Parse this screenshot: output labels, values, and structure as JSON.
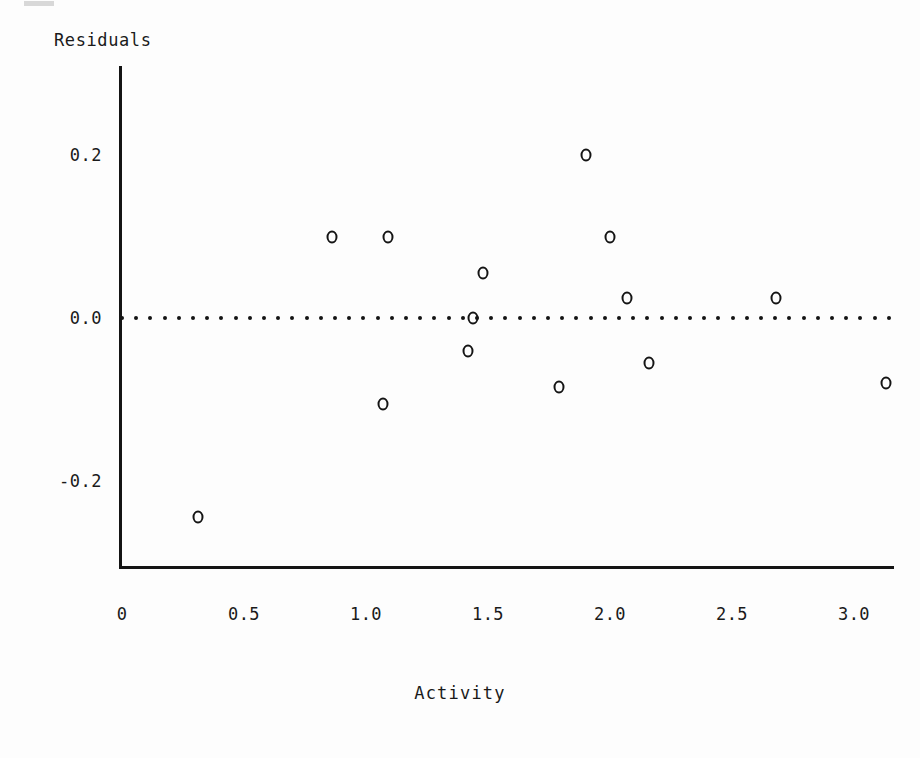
{
  "figure": {
    "y_axis_title": "Residuals",
    "x_axis_title": "Activity"
  },
  "chart_data": {
    "type": "scatter",
    "title": "",
    "xlabel": "Activity",
    "ylabel": "Residuals",
    "xlim": [
      0.0,
      3.2
    ],
    "ylim": [
      -0.3,
      0.26
    ],
    "grid": false,
    "legend": null,
    "marker": "open-circle",
    "reference_line": {
      "orientation": "horizontal",
      "value": 0.0,
      "style": "dotted",
      "x_start": 0.0,
      "x_end": 3.15
    },
    "xticks": [
      0,
      0.5,
      1.0,
      1.5,
      2.0,
      2.5,
      3.0
    ],
    "xticklabels": [
      "0",
      "0.5",
      "1.0",
      "1.5",
      "2.0",
      "2.5",
      "3.0"
    ],
    "yticks": [
      0.2,
      0.0,
      -0.2
    ],
    "yticklabels": [
      "0.2",
      "0.0",
      "-0.2"
    ],
    "series": [
      {
        "name": "residuals",
        "points": [
          {
            "x": 0.31,
            "y": -0.244
          },
          {
            "x": 0.86,
            "y": 0.1
          },
          {
            "x": 1.07,
            "y": -0.105
          },
          {
            "x": 1.09,
            "y": 0.1
          },
          {
            "x": 1.42,
            "y": -0.04
          },
          {
            "x": 1.44,
            "y": 0.0
          },
          {
            "x": 1.48,
            "y": 0.055
          },
          {
            "x": 1.79,
            "y": -0.085
          },
          {
            "x": 1.9,
            "y": 0.2
          },
          {
            "x": 2.0,
            "y": 0.1
          },
          {
            "x": 2.07,
            "y": 0.025
          },
          {
            "x": 2.16,
            "y": -0.055
          },
          {
            "x": 2.68,
            "y": 0.025
          },
          {
            "x": 3.13,
            "y": -0.08
          }
        ]
      }
    ]
  }
}
